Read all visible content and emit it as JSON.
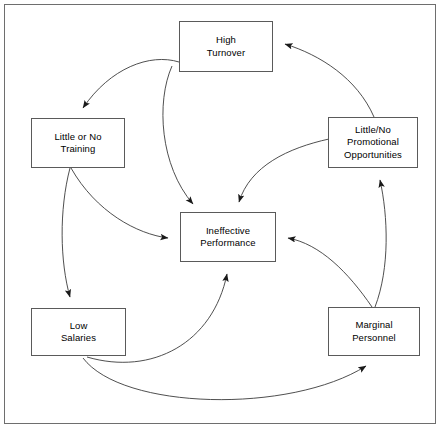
{
  "diagram": {
    "type": "causal-loop-flow-diagram",
    "frame": {
      "border_color": "#6e6e6e",
      "background": "#ffffff"
    },
    "node_style": {
      "border_color": "#5a5a5a",
      "fill": "#ffffff",
      "text_color": "#000000"
    },
    "edge_style": {
      "stroke": "#3b3b3b",
      "arrowhead": "filled-triangle"
    },
    "nodes": [
      {
        "id": "high-turnover",
        "label": "High\nTurnover",
        "x": 179,
        "y": 21,
        "w": 94,
        "h": 51
      },
      {
        "id": "little-or-no-training",
        "label": "Little or No\nTraining",
        "x": 31,
        "y": 118,
        "w": 94,
        "h": 50
      },
      {
        "id": "little-no-promotional-opportunities",
        "label": "Little/No\nPromotional\nOpportunities",
        "x": 328,
        "y": 117,
        "w": 90,
        "h": 51
      },
      {
        "id": "ineffective-performance",
        "label": "Ineffective\nPerformance",
        "x": 180,
        "y": 212,
        "w": 96,
        "h": 50
      },
      {
        "id": "low-salaries",
        "label": "Low\nSalaries",
        "x": 31,
        "y": 308,
        "w": 95,
        "h": 48
      },
      {
        "id": "marginal-personnel",
        "label": "Marginal\nPersonnel",
        "x": 328,
        "y": 307,
        "w": 92,
        "h": 49
      }
    ],
    "edges": [
      {
        "id": "edge-turnover-to-training",
        "from": "high-turnover",
        "to": "little-or-no-training"
      },
      {
        "id": "edge-turnover-to-performance",
        "from": "high-turnover",
        "to": "ineffective-performance"
      },
      {
        "id": "edge-training-to-salaries",
        "from": "little-or-no-training",
        "to": "low-salaries"
      },
      {
        "id": "edge-training-to-performance",
        "from": "little-or-no-training",
        "to": "ineffective-performance"
      },
      {
        "id": "edge-salaries-to-performance",
        "from": "low-salaries",
        "to": "ineffective-performance"
      },
      {
        "id": "edge-salaries-to-marginal",
        "from": "low-salaries",
        "to": "marginal-personnel"
      },
      {
        "id": "edge-marginal-to-promotional",
        "from": "marginal-personnel",
        "to": "little-no-promotional-opportunities"
      },
      {
        "id": "edge-marginal-to-performance",
        "from": "marginal-personnel",
        "to": "ineffective-performance"
      },
      {
        "id": "edge-promotional-to-turnover",
        "from": "little-no-promotional-opportunities",
        "to": "high-turnover"
      },
      {
        "id": "edge-promotional-to-performance",
        "from": "little-no-promotional-opportunities",
        "to": "ineffective-performance"
      }
    ]
  }
}
